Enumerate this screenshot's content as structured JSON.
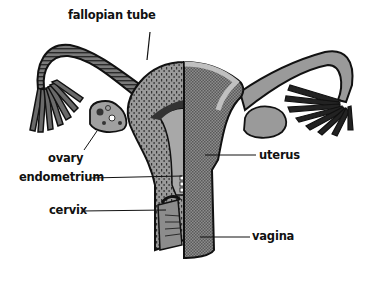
{
  "diagram": {
    "labels": {
      "fallopian_tube": "fallopian tube",
      "ovary": "ovary",
      "endometrium": "endometrium",
      "cervix": "cervix",
      "uterus": "uterus",
      "vagina": "vagina"
    },
    "colors": {
      "outline": "#111111",
      "left_fill": "#8a8a8a",
      "right_fill": "#7a7a7a",
      "light_band": "#b8b8b8",
      "cavity": "#a8a8a8",
      "background": "#ffffff"
    }
  }
}
